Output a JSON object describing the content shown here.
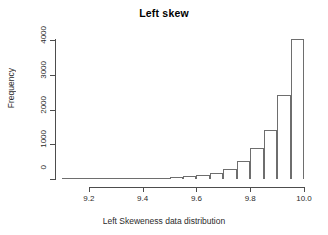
{
  "chart_data": {
    "type": "bar",
    "title": "Left skew",
    "xlabel": "Left Skeweness data distribution",
    "ylabel": "Frequency",
    "xlim": [
      9.1,
      10.0
    ],
    "ylim": [
      0,
      4000
    ],
    "grid": false,
    "legend": null,
    "bin_width": 0.05,
    "xticks": [
      "9.2",
      "9.4",
      "9.6",
      "9.8",
      "10.0"
    ],
    "xtick_values": [
      9.2,
      9.4,
      9.6,
      9.8,
      10.0
    ],
    "yticks": [
      "0",
      "1000",
      "2000",
      "3000",
      "4000"
    ],
    "ytick_values": [
      0,
      1000,
      2000,
      3000,
      4000
    ],
    "bin_edges": [
      9.1,
      9.15,
      9.2,
      9.25,
      9.3,
      9.35,
      9.4,
      9.45,
      9.5,
      9.55,
      9.6,
      9.65,
      9.7,
      9.75,
      9.8,
      9.85,
      9.9,
      9.95,
      10.0
    ],
    "categories": [
      "9.10-9.15",
      "9.15-9.20",
      "9.20-9.25",
      "9.25-9.30",
      "9.30-9.35",
      "9.35-9.40",
      "9.40-9.45",
      "9.45-9.50",
      "9.50-9.55",
      "9.55-9.60",
      "9.60-9.65",
      "9.65-9.70",
      "9.70-9.75",
      "9.75-9.80",
      "9.80-9.85",
      "9.85-9.90",
      "9.90-9.95",
      "9.95-10.00"
    ],
    "values": [
      2,
      3,
      5,
      8,
      12,
      18,
      25,
      35,
      50,
      75,
      120,
      180,
      300,
      520,
      880,
      1400,
      2430,
      4020
    ],
    "bar_fill": "#ffffff",
    "bar_edge": "#6e6e6e",
    "axis_color": "#4d4d4d",
    "background": "#ffffff"
  }
}
